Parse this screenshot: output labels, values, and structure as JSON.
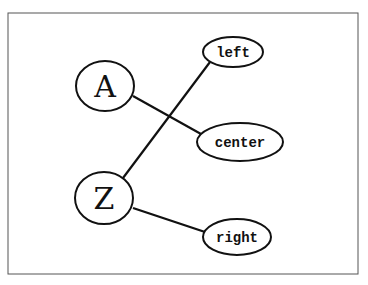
{
  "diagram": {
    "nodes": [
      {
        "id": "A",
        "label": "A",
        "shape": "circle"
      },
      {
        "id": "Z",
        "label": "Z",
        "shape": "circle"
      },
      {
        "id": "left",
        "label": "left",
        "shape": "ellipse"
      },
      {
        "id": "center",
        "label": "center",
        "shape": "ellipse"
      },
      {
        "id": "right",
        "label": "right",
        "shape": "ellipse"
      }
    ],
    "edges": [
      {
        "from": "A",
        "to": "center"
      },
      {
        "from": "Z",
        "to": "left"
      },
      {
        "from": "Z",
        "to": "right"
      }
    ]
  }
}
